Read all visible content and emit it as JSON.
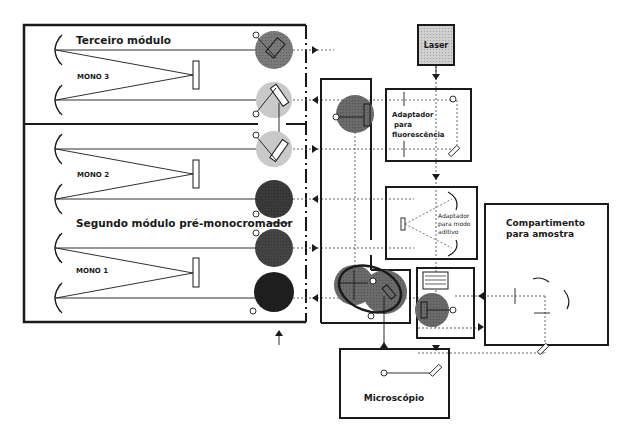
{
  "diagram": {
    "modules": {
      "third": {
        "title": "Terceiro módulo",
        "mono": "MONO 3"
      },
      "second": {
        "mono": "MONO 2"
      },
      "premono": {
        "title": "Segundo módulo pré-monocromador",
        "mono": "MONO 1"
      }
    },
    "laser": {
      "label": "Laser"
    },
    "fluorescence_adapter": {
      "line1": "Adaptador",
      "line2": "para",
      "line3": "fluorescência"
    },
    "additive_adapter": {
      "line1": "Adaptador",
      "line2": "para modo",
      "line3": "aditivo"
    },
    "sample_compartment": {
      "line1": "Compartimento",
      "line2": "para amostra"
    },
    "microscope": {
      "label": "Microscópio"
    }
  },
  "colors": {
    "line": "#1a1a1a",
    "turret_dark": "#2a2a2a",
    "turret_mid": "#5a5a5a",
    "turret_light": "#bdbdbd",
    "turret_gray": "#8a8a8a",
    "laser_fill": "#d0d0d0"
  }
}
